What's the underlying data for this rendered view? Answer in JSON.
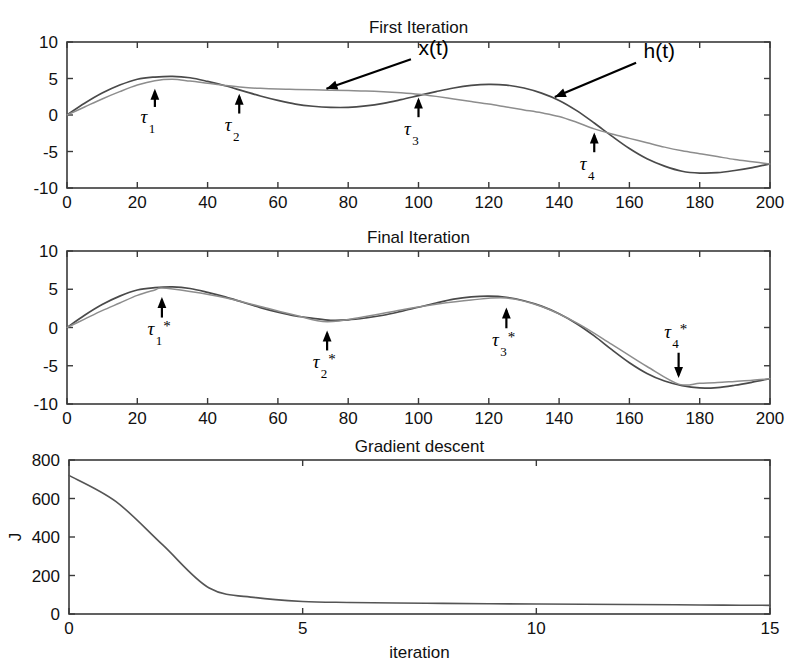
{
  "figure": {
    "width": 807,
    "height": 671,
    "background": "#ffffff",
    "curve_colors": {
      "h": "#4a4a4a",
      "x": "#8d8d8d",
      "j": "#555555",
      "axis": "#3a3a3a",
      "annotation": "#000000"
    }
  },
  "chart_data": [
    {
      "type": "line",
      "title": "First Iteration",
      "xlabel": "",
      "ylabel": "",
      "xlim": [
        0,
        200
      ],
      "ylim": [
        -10,
        10
      ],
      "xticks": [
        0,
        20,
        40,
        60,
        80,
        100,
        120,
        140,
        160,
        180,
        200
      ],
      "yticks": [
        -10,
        -5,
        0,
        5,
        10
      ],
      "xticklabels": [
        "0",
        "20",
        "40",
        "60",
        "80",
        "100",
        "120",
        "140",
        "160",
        "180",
        "200"
      ],
      "yticklabels": [
        "-10",
        "-5",
        "0",
        "5",
        "10"
      ],
      "grid": false,
      "legend": "none",
      "series": [
        {
          "name": "h(t)",
          "color": "#4a4a4a",
          "x": [
            0,
            5,
            10,
            15,
            20,
            25,
            30,
            35,
            40,
            45,
            50,
            55,
            60,
            65,
            70,
            75,
            80,
            85,
            90,
            95,
            100,
            105,
            110,
            115,
            120,
            125,
            130,
            135,
            140,
            145,
            150,
            155,
            160,
            165,
            170,
            175,
            180,
            185,
            190,
            195,
            200
          ],
          "y": [
            0.0,
            1.6,
            3.0,
            4.1,
            4.9,
            5.2,
            5.3,
            5.1,
            4.6,
            4.0,
            3.3,
            2.6,
            2.0,
            1.5,
            1.2,
            1.05,
            1.05,
            1.25,
            1.6,
            2.1,
            2.65,
            3.2,
            3.7,
            4.05,
            4.2,
            4.1,
            3.7,
            3.0,
            2.0,
            0.6,
            -1.1,
            -2.9,
            -4.6,
            -6.0,
            -7.0,
            -7.7,
            -7.95,
            -7.9,
            -7.6,
            -7.2,
            -6.7
          ]
        },
        {
          "name": "x(t)",
          "color": "#8d8d8d",
          "x": [
            0,
            5,
            10,
            15,
            20,
            25,
            30,
            35,
            40,
            45,
            50,
            55,
            60,
            65,
            70,
            75,
            80,
            85,
            90,
            95,
            100,
            105,
            110,
            115,
            120,
            125,
            130,
            135,
            140,
            145,
            150,
            155,
            160,
            165,
            170,
            175,
            180,
            185,
            190,
            195,
            200
          ],
          "y": [
            0.0,
            1.1,
            2.2,
            3.2,
            4.1,
            4.7,
            4.9,
            4.65,
            4.35,
            4.05,
            3.8,
            3.65,
            3.55,
            3.5,
            3.45,
            3.4,
            3.35,
            3.3,
            3.2,
            3.05,
            2.85,
            2.55,
            2.2,
            1.85,
            1.5,
            1.1,
            0.7,
            0.3,
            -0.2,
            -1.0,
            -1.9,
            -2.6,
            -3.2,
            -3.8,
            -4.4,
            -4.9,
            -5.3,
            -5.7,
            -6.1,
            -6.4,
            -6.7
          ]
        }
      ],
      "annotations": [
        {
          "text": "x(t)",
          "x": 100,
          "y": 8.0,
          "arrow_to_x": 73,
          "arrow_to_y": 3.45,
          "kind": "label-arrow"
        },
        {
          "text": "h(t)",
          "x": 164,
          "y": 7.6,
          "arrow_to_x": 138,
          "arrow_to_y": 2.3,
          "kind": "label-arrow"
        },
        {
          "label": "τ",
          "sub": "1",
          "star": false,
          "t": 25,
          "direction": "up",
          "tip_y": 3.6,
          "tail_y": 1.1,
          "text_y": -1.1
        },
        {
          "label": "τ",
          "sub": "2",
          "star": false,
          "t": 49,
          "direction": "up",
          "tip_y": 2.9,
          "tail_y": 0.2,
          "text_y": -2.2
        },
        {
          "label": "τ",
          "sub": "3",
          "star": false,
          "t": 100,
          "direction": "up",
          "tip_y": 2.4,
          "tail_y": -0.3,
          "text_y": -2.7
        },
        {
          "label": "τ",
          "sub": "4",
          "star": false,
          "t": 150,
          "direction": "up",
          "tip_y": -2.4,
          "tail_y": -5.1,
          "text_y": -7.5
        }
      ]
    },
    {
      "type": "line",
      "title": "Final Iteration",
      "xlabel": "",
      "ylabel": "",
      "xlim": [
        0,
        200
      ],
      "ylim": [
        -10,
        10
      ],
      "xticks": [
        0,
        20,
        40,
        60,
        80,
        100,
        120,
        140,
        160,
        180,
        200
      ],
      "yticks": [
        -10,
        -5,
        0,
        5,
        10
      ],
      "xticklabels": [
        "0",
        "20",
        "40",
        "60",
        "80",
        "100",
        "120",
        "140",
        "160",
        "180",
        "200"
      ],
      "yticklabels": [
        "-10",
        "-5",
        "0",
        "5",
        "10"
      ],
      "grid": false,
      "legend": "none",
      "series": [
        {
          "name": "h(t)",
          "color": "#4a4a4a",
          "x": [
            0,
            5,
            10,
            15,
            20,
            25,
            30,
            35,
            40,
            45,
            50,
            55,
            60,
            65,
            70,
            75,
            80,
            85,
            90,
            95,
            100,
            105,
            110,
            115,
            120,
            125,
            130,
            135,
            140,
            145,
            150,
            155,
            160,
            165,
            170,
            175,
            180,
            185,
            190,
            195,
            200
          ],
          "y": [
            0.0,
            1.6,
            3.0,
            4.1,
            4.9,
            5.2,
            5.3,
            5.1,
            4.6,
            4.0,
            3.3,
            2.6,
            2.0,
            1.5,
            1.2,
            0.95,
            1.0,
            1.25,
            1.6,
            2.1,
            2.65,
            3.2,
            3.7,
            4.0,
            4.1,
            3.95,
            3.5,
            2.8,
            1.8,
            0.5,
            -1.1,
            -2.9,
            -4.6,
            -6.0,
            -7.0,
            -7.6,
            -7.9,
            -7.85,
            -7.55,
            -7.15,
            -6.7
          ]
        },
        {
          "name": "x(t)",
          "color": "#8d8d8d",
          "x": [
            0,
            5,
            10,
            15,
            20,
            25,
            27,
            35,
            45,
            55,
            65,
            74,
            85,
            95,
            105,
            115,
            125,
            135,
            145,
            155,
            165,
            174,
            180,
            185,
            190,
            195,
            200
          ],
          "y": [
            0.0,
            1.1,
            2.2,
            3.2,
            4.2,
            4.9,
            5.15,
            4.7,
            3.9,
            2.75,
            1.6,
            0.75,
            1.45,
            2.3,
            3.05,
            3.6,
            3.85,
            2.75,
            0.6,
            -2.2,
            -5.1,
            -7.4,
            -7.3,
            -7.2,
            -7.05,
            -6.9,
            -6.7
          ]
        }
      ],
      "annotations": [
        {
          "label": "τ",
          "sub": "1",
          "star": true,
          "t": 27,
          "direction": "up",
          "tip_y": 4.0,
          "tail_y": 1.3,
          "text_y": -1.0
        },
        {
          "label": "τ",
          "sub": "2",
          "star": true,
          "t": 74,
          "direction": "up",
          "tip_y": -0.4,
          "tail_y": -3.0,
          "text_y": -5.3
        },
        {
          "label": "τ",
          "sub": "3",
          "star": true,
          "t": 125,
          "direction": "up",
          "tip_y": 2.6,
          "tail_y": -0.1,
          "text_y": -2.4
        },
        {
          "label": "τ",
          "sub": "4",
          "star": true,
          "t": 174,
          "direction": "down",
          "tip_y": -6.6,
          "tail_y": -3.3,
          "text_y": -1.4
        }
      ]
    },
    {
      "type": "line",
      "title": "Gradient descent",
      "xlabel": "iteration",
      "ylabel": "J",
      "xlim": [
        0,
        15
      ],
      "ylim": [
        0,
        800
      ],
      "xticks": [
        0,
        5,
        10,
        15
      ],
      "yticks": [
        0,
        200,
        400,
        600,
        800
      ],
      "xticklabels": [
        "0",
        "5",
        "10",
        "15"
      ],
      "yticklabels": [
        "0",
        "200",
        "400",
        "600",
        "800"
      ],
      "grid": false,
      "legend": "none",
      "series": [
        {
          "name": "J",
          "color": "#555555",
          "x": [
            0,
            1,
            2,
            3,
            4,
            5,
            6,
            7,
            8,
            9,
            10,
            11,
            12,
            13,
            14,
            15
          ],
          "y": [
            720,
            585,
            360,
            135,
            85,
            65,
            60,
            57,
            55,
            53,
            52,
            51,
            49,
            48,
            46,
            45
          ]
        }
      ],
      "annotations": []
    }
  ]
}
